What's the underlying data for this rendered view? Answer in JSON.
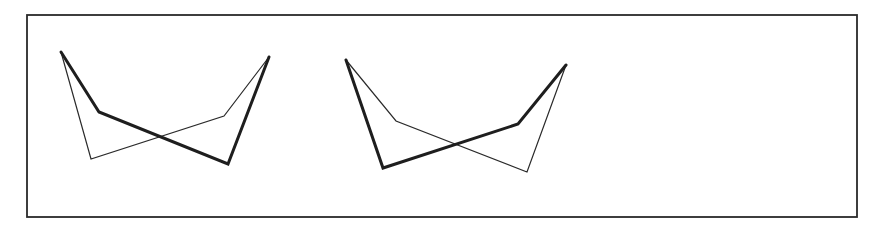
{
  "diagram": {
    "frame": {
      "x": 27,
      "y": 15,
      "width": 830,
      "height": 202
    },
    "colors": {
      "stroke": "#1e1e1e",
      "background": "#ffffff"
    },
    "figures": [
      {
        "name": "figure-left",
        "thick_path": [
          [
            61,
            52
          ],
          [
            99,
            112
          ],
          [
            228,
            164
          ],
          [
            269,
            57
          ]
        ],
        "thin_path": [
          [
            61,
            52
          ],
          [
            91,
            159
          ],
          [
            224,
            116
          ],
          [
            269,
            57
          ]
        ]
      },
      {
        "name": "figure-right",
        "thick_path": [
          [
            346,
            60
          ],
          [
            383,
            168
          ],
          [
            518,
            124
          ],
          [
            566,
            65
          ]
        ],
        "thin_path": [
          [
            346,
            60
          ],
          [
            396,
            121
          ],
          [
            527,
            172
          ],
          [
            566,
            65
          ]
        ]
      }
    ]
  }
}
